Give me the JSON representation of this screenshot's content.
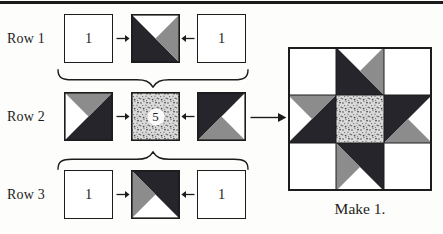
{
  "figure_type": "quilt-block-assembly-diagram",
  "rows": [
    {
      "label": "Row 1",
      "left_square": "1",
      "right_square": "1"
    },
    {
      "label": "Row 2",
      "center_square": "5"
    },
    {
      "label": "Row 3",
      "left_square": "1",
      "right_square": "1"
    }
  ],
  "result": {
    "caption": "Make 1."
  },
  "icons": {
    "arrow_right": "right-arrow",
    "arrow_left": "left-arrow",
    "assemble_arrow": "long-right-arrow",
    "brace_down": "underbrace-cusp-down",
    "brace_up": "overbrace-cusp-up"
  },
  "colors": {
    "ink": "#1c1c1c",
    "dark": "#25252b",
    "gray": "#8c8c8c",
    "stipple_base": "#dbdbdb",
    "stipple_dot": "#4d4d4d",
    "background": "#fdfdfb"
  }
}
